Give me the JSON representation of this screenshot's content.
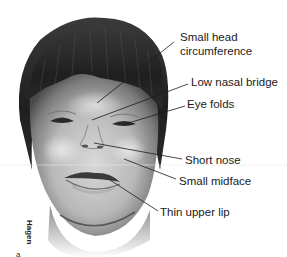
{
  "figure": {
    "signature": "Hagen",
    "figure_marker": "a",
    "labels": [
      {
        "id": "small-head",
        "lines": [
          "Small head",
          "circumference"
        ]
      },
      {
        "id": "low-nasal-bridge",
        "text": "Low nasal bridge"
      },
      {
        "id": "eye-folds",
        "text": "Eye folds"
      },
      {
        "id": "short-nose",
        "text": "Short nose"
      },
      {
        "id": "small-midface",
        "text": "Small midface"
      },
      {
        "id": "thin-upper-lip",
        "text": "Thin upper lip"
      }
    ]
  }
}
